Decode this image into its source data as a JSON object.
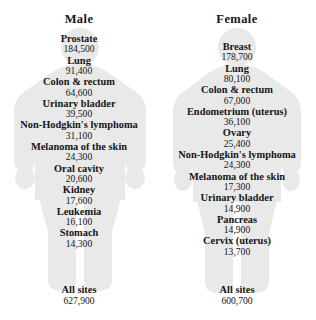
{
  "figure": {
    "type": "ranked-list-infographic",
    "silhouette_color": "#e9e9e9",
    "text_color": "#151515",
    "columns": [
      {
        "id": "male",
        "title": "Male",
        "silhouette": "male-body-silhouette",
        "entries": [
          {
            "site": "Prostate",
            "count": "184,500"
          },
          {
            "site": "Lung",
            "count": "91,400"
          },
          {
            "site": "Colon & rectum",
            "count": "64,600"
          },
          {
            "site": "Urinary bladder",
            "count": "39,500"
          },
          {
            "site": "Non-Hodgkin's lymphoma",
            "count": "31,100"
          },
          {
            "site": "Melanoma of the skin",
            "count": "24,300"
          },
          {
            "site": "Oral cavity",
            "count": "20,600"
          },
          {
            "site": "Kidney",
            "count": "17,600"
          },
          {
            "site": "Leukemia",
            "count": "16,100"
          },
          {
            "site": "Stomach",
            "count": "14,300"
          }
        ],
        "total": {
          "site": "All sites",
          "count": "627,900"
        }
      },
      {
        "id": "female",
        "title": "Female",
        "silhouette": "female-body-silhouette",
        "entries": [
          {
            "site": "Breast",
            "count": "178,700"
          },
          {
            "site": "Lung",
            "count": "80,100"
          },
          {
            "site": "Colon & rectum",
            "count": "67,000"
          },
          {
            "site": "Endometrium (uterus)",
            "count": "36,100"
          },
          {
            "site": "Ovary",
            "count": "25,400"
          },
          {
            "site": "Non-Hodgkin's lymphoma",
            "count": "24,300"
          },
          {
            "site": "Melanoma of the skin",
            "count": "17,300"
          },
          {
            "site": "Urinary bladder",
            "count": "14,900"
          },
          {
            "site": "Pancreas",
            "count": "14,900"
          },
          {
            "site": "Cervix (uterus)",
            "count": "13,700"
          }
        ],
        "total": {
          "site": "All sites",
          "count": "600,700"
        }
      }
    ]
  }
}
